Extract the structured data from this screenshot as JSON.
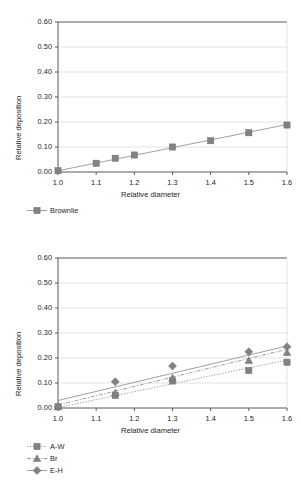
{
  "figure": {
    "cropped_title": "",
    "background": "#ffffff"
  },
  "axis": {
    "xlabel": "Relative diameter",
    "ylabel": "Relative deposition",
    "yticks": [
      "0.00",
      "0.10",
      "0.20",
      "0.30",
      "0.40",
      "0.50",
      "0.60"
    ],
    "xticks": [
      "1.0",
      "1.1",
      "1.2",
      "1.3",
      "1.4",
      "1.5",
      "1.6"
    ]
  },
  "colors": {
    "marker_gray": "#808285",
    "line_gray": "#939598",
    "grid": "#d7d7d7",
    "axis": "#58595b",
    "text": "#231f20"
  },
  "panel1": {
    "legend": [
      {
        "label": "Brownlie",
        "marker": "square",
        "line": "solid"
      }
    ]
  },
  "panel2": {
    "legend": [
      {
        "label": "A-W",
        "marker": "square",
        "line": "dotted"
      },
      {
        "label": "Br",
        "marker": "triangle",
        "line": "dashdot"
      },
      {
        "label": "E-H",
        "marker": "diamond",
        "line": "solid"
      }
    ]
  },
  "chart_data": [
    {
      "type": "scatter",
      "panel": 1,
      "title": "",
      "xlabel": "Relative diameter",
      "ylabel": "Relative deposition",
      "xlim": [
        1.0,
        1.6
      ],
      "ylim": [
        0.0,
        0.6
      ],
      "xticks": [
        1.0,
        1.1,
        1.2,
        1.3,
        1.4,
        1.5,
        1.6
      ],
      "yticks": [
        0.0,
        0.1,
        0.2,
        0.3,
        0.4,
        0.5,
        0.6
      ],
      "grid": "horizontal",
      "legend_position": "below-left",
      "series": [
        {
          "name": "Brownlie",
          "marker": "square",
          "line": "solid",
          "x": [
            1.0,
            1.1,
            1.15,
            1.2,
            1.3,
            1.4,
            1.5,
            1.6
          ],
          "y": [
            0.005,
            0.035,
            0.055,
            0.068,
            0.1,
            0.125,
            0.157,
            0.188
          ],
          "fit_line": {
            "x": [
              1.0,
              1.6
            ],
            "y": [
              0.005,
              0.19
            ]
          }
        }
      ]
    },
    {
      "type": "scatter",
      "panel": 2,
      "title": "",
      "xlabel": "Relative diameter",
      "ylabel": "Relative deposition",
      "xlim": [
        1.0,
        1.6
      ],
      "ylim": [
        0.0,
        0.6
      ],
      "xticks": [
        1.0,
        1.1,
        1.2,
        1.3,
        1.4,
        1.5,
        1.6
      ],
      "yticks": [
        0.0,
        0.1,
        0.2,
        0.3,
        0.4,
        0.5,
        0.6
      ],
      "grid": "horizontal",
      "legend_position": "below-left",
      "series": [
        {
          "name": "A-W",
          "marker": "square",
          "line": "dotted",
          "x": [
            1.0,
            1.15,
            1.3,
            1.5,
            1.6
          ],
          "y": [
            0.005,
            0.05,
            0.108,
            0.15,
            0.183
          ],
          "fit_line": {
            "x": [
              1.0,
              1.6
            ],
            "y": [
              0.002,
              0.192
            ]
          }
        },
        {
          "name": "Br",
          "marker": "triangle",
          "line": "dashdot",
          "x": [
            1.0,
            1.15,
            1.3,
            1.5,
            1.6
          ],
          "y": [
            0.005,
            0.06,
            0.12,
            0.19,
            0.222
          ],
          "fit_line": {
            "x": [
              1.0,
              1.6
            ],
            "y": [
              0.012,
              0.235
            ]
          }
        },
        {
          "name": "E-H",
          "marker": "diamond",
          "line": "solid",
          "x": [
            1.0,
            1.15,
            1.3,
            1.5,
            1.6
          ],
          "y": [
            0.005,
            0.105,
            0.168,
            0.225,
            0.245
          ],
          "fit_line": {
            "x": [
              1.0,
              1.6
            ],
            "y": [
              0.03,
              0.248
            ]
          }
        }
      ]
    }
  ]
}
